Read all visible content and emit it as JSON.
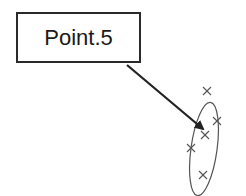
{
  "diagram": {
    "label": {
      "text": "Point.5",
      "x": 16,
      "y": 12,
      "w": 125,
      "h": 51
    },
    "arrow": {
      "x1": 127,
      "y1": 65,
      "x2": 203,
      "y2": 129,
      "color": "#222222"
    },
    "ellipse": {
      "cx": 204,
      "cy": 149,
      "rx": 13,
      "ry": 47,
      "color": "#555555"
    },
    "markers": [
      {
        "x": 207,
        "y": 91
      },
      {
        "x": 217,
        "y": 121
      },
      {
        "x": 205,
        "y": 135
      },
      {
        "x": 191,
        "y": 148
      },
      {
        "x": 203,
        "y": 175
      }
    ],
    "marker_icon": "x-mark-icon"
  }
}
